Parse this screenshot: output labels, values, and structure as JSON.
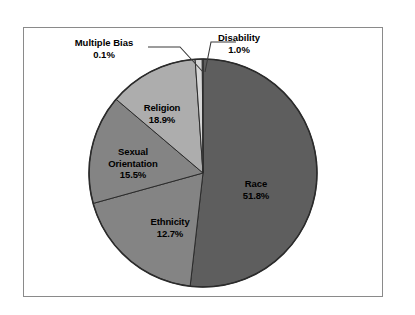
{
  "chart_data": {
    "type": "pie",
    "title": "",
    "subtitle": "",
    "xlabel": "",
    "ylabel": "",
    "legend_position": "none",
    "grid": false,
    "units": "percent",
    "total": 100.0,
    "start_angle_deg": 0,
    "direction": "clockwise",
    "categories": [
      "Race",
      "Religion",
      "Sexual Orientation",
      "Ethnicity",
      "Disability",
      "Multiple Bias"
    ],
    "values": [
      51.8,
      18.9,
      15.5,
      12.7,
      1.0,
      0.1
    ],
    "slices": [
      {
        "label": "Race",
        "value": 51.8,
        "value_text": "51.8%",
        "color": "#5e5e5e",
        "label_placement": "inside",
        "label_x": 256,
        "label_y": 184
      },
      {
        "label": "Religion",
        "value": 18.9,
        "value_text": "18.9%",
        "color": "#848484",
        "label_placement": "inside",
        "label_x": 162,
        "label_y": 108
      },
      {
        "label": "Sexual Orientation",
        "label_line1": "Sexual",
        "label_line2": "Orientation",
        "value": 15.5,
        "value_text": "15.5%",
        "color": "#848484",
        "label_placement": "inside",
        "label_x": 133,
        "label_y": 153
      },
      {
        "label": "Ethnicity",
        "value": 12.7,
        "value_text": "12.7%",
        "color": "#adadad",
        "label_placement": "inside",
        "label_x": 170,
        "label_y": 222
      },
      {
        "label": "Disability",
        "value": 1.0,
        "value_text": "1.0%",
        "color": "#d6d6d6",
        "label_placement": "callout-right",
        "label_x": 238,
        "label_y": 38
      },
      {
        "label": "Multiple Bias",
        "value": 0.1,
        "value_text": "0.1%",
        "color": "#f2f2f2",
        "label_placement": "callout-left",
        "label_x": 103,
        "label_y": 43
      }
    ],
    "geometry": {
      "center_x": 203,
      "center_y": 173,
      "radius": 114
    },
    "style": {
      "frame_color": "#8a8a8a",
      "background": "#ffffff",
      "slice_outline": "#2b2b2b",
      "label_color": "#000000",
      "leader_line_color": "#3a3a3a"
    }
  }
}
